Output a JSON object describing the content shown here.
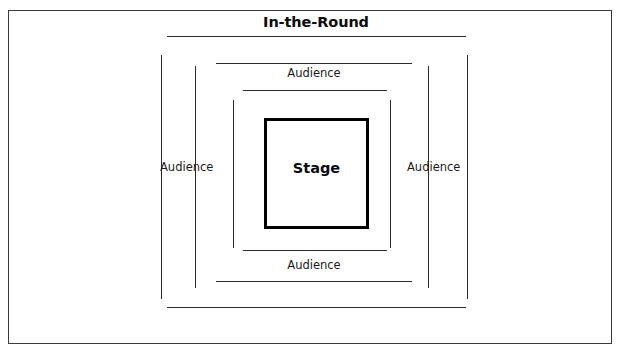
{
  "diagram": {
    "title": "In-the-Round",
    "stage_label": "Stage",
    "audience_top": "Audience",
    "audience_bottom": "Audience",
    "audience_left": "Audience",
    "audience_right": "Audience",
    "colors": {
      "frame": "#3a3a3a",
      "rule": "#2b2b2b",
      "stage_border": "#000000",
      "text": "#0a0a0a",
      "background": "#ffffff"
    },
    "rings": [
      {
        "name": "ring-1-outermost",
        "top_line": {
          "x": 167,
          "y": 36,
          "width": 299
        },
        "bottom_line": {
          "x": 167,
          "y": 307,
          "width": 299
        },
        "left_line": {
          "x": 161,
          "y": 55,
          "height": 244
        },
        "right_line": {
          "x": 467,
          "y": 55,
          "height": 244
        }
      },
      {
        "name": "ring-2",
        "top_line": {
          "x": 216,
          "y": 63,
          "width": 196
        },
        "bottom_line": {
          "x": 216,
          "y": 281,
          "width": 196
        },
        "left_line": {
          "x": 195,
          "y": 66,
          "height": 222
        },
        "right_line": {
          "x": 428,
          "y": 66,
          "height": 222
        }
      },
      {
        "name": "ring-3",
        "top_line": {
          "x": 243,
          "y": 90,
          "width": 144
        },
        "bottom_line": {
          "x": 243,
          "y": 250,
          "width": 144
        },
        "left_line": {
          "x": 233,
          "y": 100,
          "height": 148
        },
        "right_line": {
          "x": 390,
          "y": 100,
          "height": 148
        }
      }
    ],
    "stage_box": {
      "x": 264,
      "y": 118,
      "width": 105,
      "height": 111
    },
    "outer_frame": {
      "x": 8,
      "y": 10,
      "width": 604,
      "height": 334
    }
  }
}
